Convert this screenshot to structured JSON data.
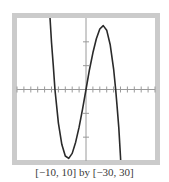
{
  "caption": "[−10, 10] by [−30, 30]",
  "colors": {
    "frame": "#cbcbcb",
    "axis": "#9a9a9a",
    "curve": "#2a2a2a"
  },
  "chart_data": {
    "type": "line",
    "title": "",
    "xlabel": "",
    "ylabel": "",
    "xlim": [
      -10,
      10
    ],
    "ylim": [
      -30,
      30
    ],
    "xscl": 1,
    "yscl": 10,
    "grid": false,
    "legend": null,
    "annotation": "[−10, 10] by [−30, 30]",
    "series": [
      {
        "name": "cubic",
        "description": "decreasing cubic with roots near x≈-4.5, 0, 4.3; local min ≈ -29 near x≈-2.5, local max ≈ 27 near x≈2.5",
        "x": [
          -5.2,
          -5.0,
          -4.75,
          -4.5,
          -4.0,
          -3.5,
          -3.0,
          -2.5,
          -2.0,
          -1.5,
          -1.0,
          -0.5,
          0.0,
          0.5,
          1.0,
          1.5,
          2.0,
          2.5,
          3.0,
          3.5,
          4.0,
          4.3,
          4.5,
          4.75,
          5.0
        ],
        "y": [
          29.4,
          19.8,
          10.4,
          0.0,
          -14.1,
          -23.1,
          -27.9,
          -28.9,
          -26.8,
          -22.1,
          -15.8,
          -8.2,
          0.0,
          8.3,
          15.4,
          21.3,
          25.4,
          26.8,
          24.9,
          18.9,
          8.7,
          0.0,
          -6.9,
          -15.9,
          -28.3
        ]
      }
    ]
  }
}
